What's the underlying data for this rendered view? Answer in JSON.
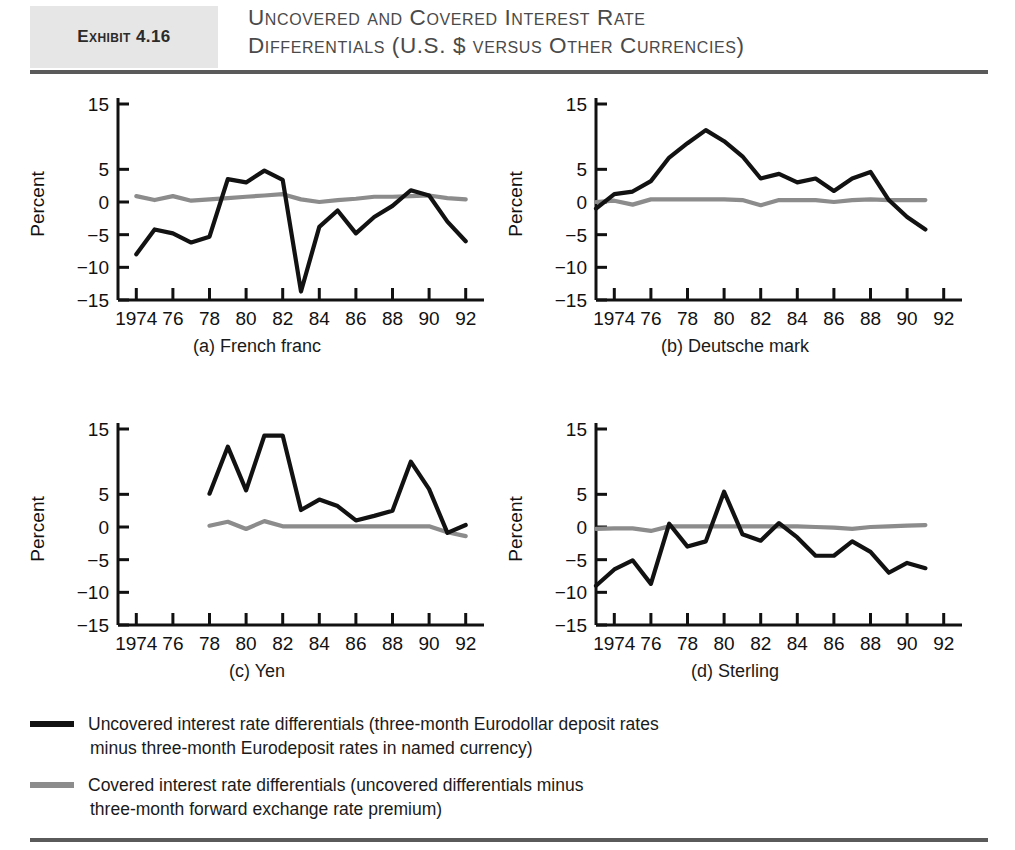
{
  "exhibit": {
    "tag": "Exhibit 4.16",
    "title_line1": "Uncovered and Covered Interest Rate",
    "title_line2": "Differentials (U.S. $ versus Other Currencies)"
  },
  "legend": {
    "series1_line1": "Uncovered interest rate differentials (three-month Eurodollar deposit rates",
    "series1_line2": "minus three-month Eurodeposit rates in named currency)",
    "series2_line1": "Covered interest rate differentials (uncovered differentials minus",
    "series2_line2": "three-month forward exchange rate premium)"
  },
  "axis": {
    "ylabel": "Percent",
    "ytick_labels": [
      "15",
      "5",
      "0",
      "−5",
      "−10",
      "−15"
    ],
    "ytick_values": [
      15,
      5,
      0,
      -5,
      -10,
      -15
    ],
    "xtick_labels": [
      "1974",
      "76",
      "78",
      "80",
      "82",
      "84",
      "86",
      "88",
      "90",
      "92"
    ],
    "xtick_values": [
      1974,
      1976,
      1978,
      1980,
      1982,
      1984,
      1986,
      1988,
      1990,
      1992
    ]
  },
  "colors": {
    "uncovered": "#121212",
    "covered": "#8c8c8c",
    "axis": "#111111",
    "header_band": "#e6e6e6",
    "rule": "#5a5a5a"
  },
  "chart_data": [
    {
      "type": "line",
      "panel": "a",
      "title": "(a) French franc",
      "xlabel": "",
      "ylabel": "Percent",
      "xlim": [
        1973,
        1993
      ],
      "ylim": [
        -15,
        17
      ],
      "grid": false,
      "legend_position": "below-figure",
      "x": [
        1974,
        1975,
        1976,
        1977,
        1978,
        1979,
        1980,
        1981,
        1982,
        1983,
        1984,
        1985,
        1986,
        1987,
        1988,
        1989,
        1990,
        1991,
        1992
      ],
      "series": [
        {
          "name": "Uncovered interest rate differentials",
          "color": "#121212",
          "values": [
            -8.0,
            -4.2,
            -4.8,
            -6.2,
            -5.3,
            3.5,
            3.0,
            4.8,
            3.4,
            -13.7,
            -3.8,
            -1.3,
            -4.8,
            -2.3,
            -0.6,
            1.8,
            1.0,
            -3.0,
            -6.0
          ]
        },
        {
          "name": "Covered interest rate differentials",
          "color": "#8c8c8c",
          "values": [
            0.9,
            0.3,
            0.9,
            0.2,
            0.4,
            0.6,
            0.8,
            1.0,
            1.2,
            0.4,
            0.0,
            0.3,
            0.5,
            0.8,
            0.8,
            0.9,
            1.0,
            0.6,
            0.4
          ]
        }
      ]
    },
    {
      "type": "line",
      "panel": "b",
      "title": "(b) Deutsche mark",
      "xlabel": "",
      "ylabel": "Percent",
      "xlim": [
        1973,
        1993
      ],
      "ylim": [
        -15,
        17
      ],
      "grid": false,
      "legend_position": "below-figure",
      "x": [
        1973,
        1974,
        1975,
        1976,
        1977,
        1978,
        1979,
        1980,
        1981,
        1982,
        1983,
        1984,
        1985,
        1986,
        1987,
        1988,
        1989,
        1990,
        1991
      ],
      "series": [
        {
          "name": "Uncovered interest rate differentials",
          "color": "#121212",
          "values": [
            -1.0,
            1.2,
            1.6,
            3.2,
            6.8,
            9.0,
            11.0,
            9.3,
            7.0,
            3.6,
            4.3,
            3.0,
            3.6,
            1.7,
            3.6,
            4.6,
            0.3,
            -2.3,
            -4.2
          ]
        },
        {
          "name": "Covered interest rate differentials",
          "color": "#8c8c8c",
          "values": [
            0.0,
            0.2,
            -0.4,
            0.4,
            0.4,
            0.4,
            0.4,
            0.4,
            0.3,
            -0.5,
            0.3,
            0.3,
            0.3,
            0.0,
            0.3,
            0.4,
            0.3,
            0.3,
            0.3
          ]
        }
      ]
    },
    {
      "type": "line",
      "panel": "c",
      "title": "(c) Yen",
      "xlabel": "",
      "ylabel": "Percent",
      "xlim": [
        1973,
        1993
      ],
      "ylim": [
        -15,
        17
      ],
      "grid": false,
      "legend_position": "below-figure",
      "x": [
        1978,
        1979,
        1980,
        1981,
        1982,
        1983,
        1984,
        1985,
        1986,
        1987,
        1988,
        1989,
        1990,
        1991,
        1992
      ],
      "series": [
        {
          "name": "Uncovered interest rate differentials",
          "color": "#121212",
          "values": [
            5.1,
            12.3,
            5.6,
            14.0,
            14.0,
            2.6,
            4.2,
            3.2,
            1.0,
            1.7,
            2.5,
            10.0,
            5.8,
            -0.9,
            0.3
          ]
        },
        {
          "name": "Covered interest rate differentials",
          "color": "#8c8c8c",
          "values": [
            0.2,
            0.8,
            -0.3,
            0.9,
            0.1,
            0.1,
            0.1,
            0.1,
            0.1,
            0.1,
            0.1,
            0.1,
            0.1,
            -0.8,
            -1.4
          ]
        }
      ]
    },
    {
      "type": "line",
      "panel": "d",
      "title": "(d) Sterling",
      "xlabel": "",
      "ylabel": "Percent",
      "xlim": [
        1973,
        1993
      ],
      "ylim": [
        -15,
        17
      ],
      "grid": false,
      "legend_position": "below-figure",
      "x": [
        1973,
        1974,
        1975,
        1976,
        1977,
        1978,
        1979,
        1980,
        1981,
        1982,
        1983,
        1984,
        1985,
        1986,
        1987,
        1988,
        1989,
        1990,
        1991
      ],
      "series": [
        {
          "name": "Uncovered interest rate differentials",
          "color": "#121212",
          "values": [
            -9.0,
            -6.5,
            -5.1,
            -8.7,
            0.5,
            -3.0,
            -2.2,
            5.4,
            -1.1,
            -2.1,
            0.6,
            -1.6,
            -4.4,
            -4.4,
            -2.2,
            -3.8,
            -7.0,
            -5.5,
            -6.3
          ]
        },
        {
          "name": "Covered interest rate differentials",
          "color": "#8c8c8c",
          "values": [
            -0.3,
            -0.2,
            -0.2,
            -0.6,
            0.1,
            0.1,
            0.1,
            0.1,
            0.1,
            0.1,
            0.1,
            0.1,
            0.0,
            -0.1,
            -0.3,
            0.0,
            0.1,
            0.2,
            0.3
          ]
        }
      ]
    }
  ]
}
